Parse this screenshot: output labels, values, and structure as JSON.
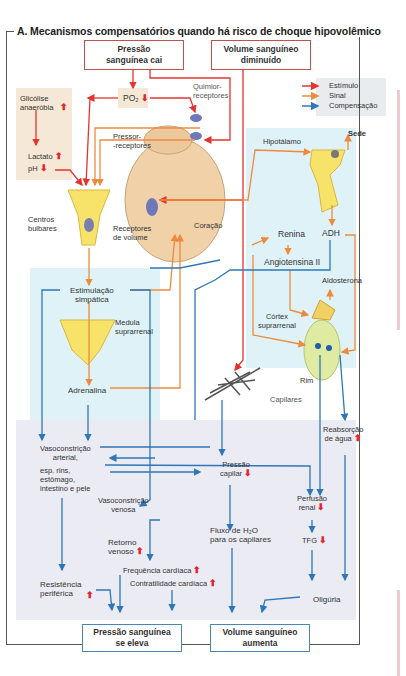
{
  "title": "A. Mecanismos compensatórios quando há risco de choque hipovolêmico",
  "top_boxes": {
    "pressure_falls": "Pressão\nsanguínea cai",
    "volume_decreased": "Volume sanguíneo\ndiminuído"
  },
  "legend": {
    "items": [
      {
        "label": "Estímulo",
        "color": "#e3342f"
      },
      {
        "label": "Sinal",
        "color": "#ef8a3c"
      },
      {
        "label": "Compensação",
        "color": "#2e77b8"
      }
    ]
  },
  "labels": {
    "po2": "PO₂",
    "glicolise": "Glicólise\nanaeróbia",
    "lactato": "Lactato",
    "ph": "pH",
    "quimioreceptores": "Quimior-\nreceptores",
    "pressoreceptores": "Pressor-\n-receptores",
    "centros_bulbares": "Centros\nbulbares",
    "receptores_volume": "Receptores\nde volume",
    "coracao": "Coração",
    "hipotalamo": "Hipotálamo",
    "sede": "Sede",
    "adh": "ADH",
    "renina": "Renina",
    "angiotensina": "Angiotensina II",
    "aldosterona": "Aldosterona",
    "cortex": "Córtex\nsuprarrenal",
    "rim": "Rim",
    "estimulacao": "Estimulação\nsimpática",
    "medula": "Medula\nsuprarrenal",
    "adrenalina": "Adrenalina",
    "capilares": "Capilares",
    "reabsorcao": "Reabsorção\nde água",
    "vasoconstricao_arterial": "Vasoconstrição\narterial,",
    "vasoconstricao_arterial_detail": "esp. rins,\nestômago,\nintestino e pele",
    "pressao_capilar": "Pressão\ncapilar",
    "perfusao_renal": "Perfusão\nrenal",
    "vasoconstricao_venosa": "Vasoconstrição\nvenosa",
    "retorno_venoso": "Retorno\nvenoso",
    "fluxo_h2o": "Fluxo de H₂O\npara os capilares",
    "tfg": "TFG",
    "frequencia": "Frequência cardíaca",
    "contratilidade": "Contratilidade cardíaca",
    "resistencia": "Resistência\nperiférica",
    "oliguria": "Oligúria"
  },
  "bottom_boxes": {
    "pressure_rises": "Pressão sanguínea\nse eleva",
    "volume_increases": "Volume sanguíneo\naumenta"
  },
  "indicators": {
    "up": "⬆",
    "down": "⬇"
  }
}
